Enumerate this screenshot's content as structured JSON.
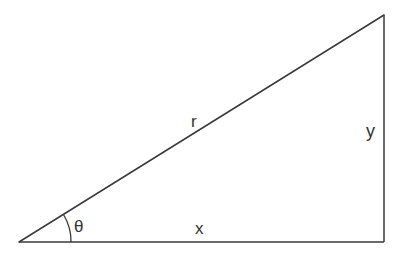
{
  "diagram": {
    "type": "right-triangle",
    "labels": {
      "hypotenuse": "r",
      "opposite": "y",
      "adjacent": "x",
      "angle": "θ"
    },
    "colors": {
      "stroke": "#3a3a3a",
      "text": "#333333",
      "background": "#ffffff"
    }
  }
}
